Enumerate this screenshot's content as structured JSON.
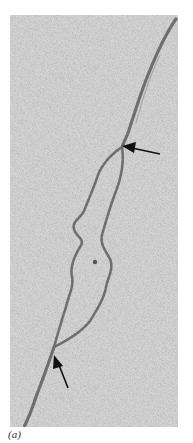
{
  "figure": {
    "panel_label": "(a)",
    "colors": {
      "background": "#cfcfcf",
      "strand": "#6e6e6e",
      "arrow": "#111111"
    },
    "arrows": [
      {
        "name": "upper-fork-arrow",
        "tip": [
          118,
          132
        ],
        "tail": [
          150,
          138
        ]
      },
      {
        "name": "lower-fork-arrow",
        "tip": [
          46,
          343
        ],
        "tail": [
          58,
          372
        ]
      }
    ]
  }
}
